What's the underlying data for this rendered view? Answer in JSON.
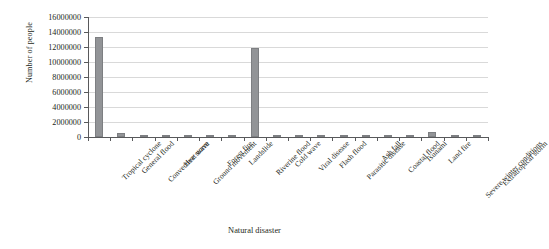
{
  "chart_data": {
    "type": "bar",
    "title": "",
    "xlabel": "Natural disaster",
    "ylabel": "Number of people",
    "ylim": [
      0,
      16000000
    ],
    "ytick_step": 2000000,
    "grid": true,
    "legend": "none",
    "bar_color": "#929497",
    "categories": [
      "Tropical cyclone",
      "General flood",
      "Convective storm",
      "Heat wave",
      "Ground movement",
      "Forest fire",
      "Landslide",
      "Riverine flood",
      "Cold wave",
      "Viral disease",
      "Flash flood",
      "Parasitic disease",
      "Ash fall",
      "Coastal flood",
      "Tsunami",
      "Land fire",
      "Severe winter conditions",
      "Extratropical storm"
    ],
    "values": [
      13400000,
      600000,
      280000,
      30000,
      20000,
      15000,
      12000,
      11900000,
      30000,
      20000,
      15000,
      300000,
      20000,
      15000,
      12000,
      620000,
      20000,
      10000
    ],
    "ytick_labels": [
      "0",
      "2000000",
      "4000000",
      "6000000",
      "8000000",
      "10000000",
      "12000000",
      "14000000",
      "16000000"
    ]
  }
}
